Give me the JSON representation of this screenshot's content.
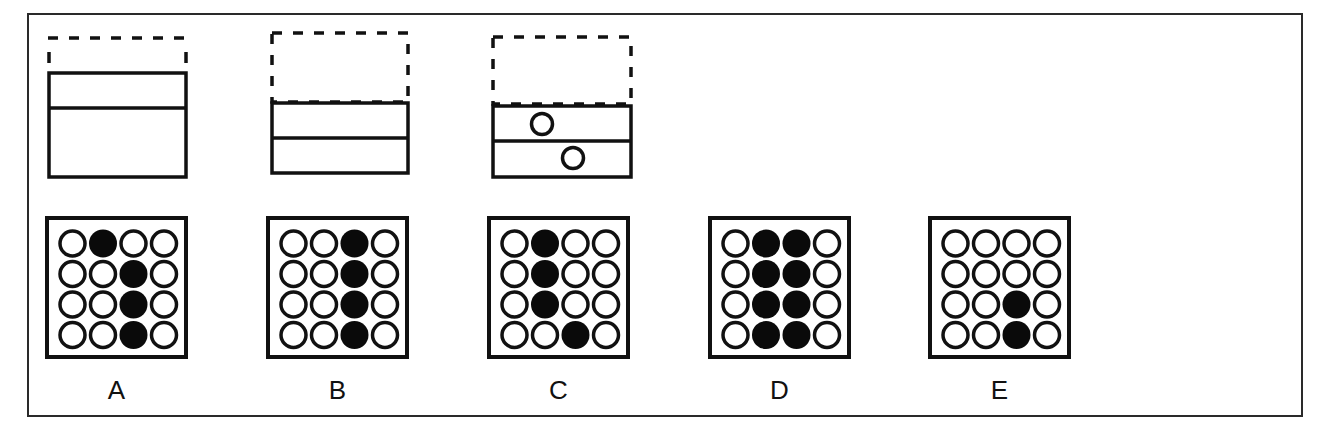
{
  "puzzle": {
    "type": "visual-reasoning-sequence",
    "stimuli": [
      {
        "id": "figure-1",
        "dashed_region": "top line with short side stubs",
        "solid_rows": 2,
        "row_heights": "short top, tall bottom",
        "circles": []
      },
      {
        "id": "figure-2",
        "dashed_region": "full dashed rectangle above",
        "solid_rows": 2,
        "row_heights": "equal",
        "circles": []
      },
      {
        "id": "figure-3",
        "dashed_region": "full dashed rectangle above",
        "solid_rows": 2,
        "row_heights": "equal",
        "circles": [
          {
            "row": 1,
            "position": "left-center"
          },
          {
            "row": 2,
            "position": "center"
          }
        ]
      }
    ],
    "options": [
      {
        "label": "A",
        "grid": [
          [
            0,
            1,
            0,
            0
          ],
          [
            0,
            0,
            1,
            0
          ],
          [
            0,
            0,
            1,
            0
          ],
          [
            0,
            0,
            1,
            0
          ]
        ]
      },
      {
        "label": "B",
        "grid": [
          [
            0,
            0,
            1,
            0
          ],
          [
            0,
            0,
            1,
            0
          ],
          [
            0,
            0,
            1,
            0
          ],
          [
            0,
            0,
            1,
            0
          ]
        ]
      },
      {
        "label": "C",
        "grid": [
          [
            0,
            1,
            0,
            0
          ],
          [
            0,
            1,
            0,
            0
          ],
          [
            0,
            1,
            0,
            0
          ],
          [
            0,
            0,
            1,
            0
          ]
        ]
      },
      {
        "label": "D",
        "grid": [
          [
            0,
            1,
            1,
            0
          ],
          [
            0,
            1,
            1,
            0
          ],
          [
            0,
            1,
            1,
            0
          ],
          [
            0,
            1,
            1,
            0
          ]
        ]
      },
      {
        "label": "E",
        "grid": [
          [
            0,
            0,
            0,
            0
          ],
          [
            0,
            0,
            0,
            0
          ],
          [
            0,
            0,
            1,
            0
          ],
          [
            0,
            0,
            1,
            0
          ]
        ]
      }
    ]
  },
  "colors": {
    "stroke": "#111111",
    "fill_dot": "#0a0a0a",
    "empty_dot": "#ffffff",
    "frame": "#2a2a2a"
  }
}
